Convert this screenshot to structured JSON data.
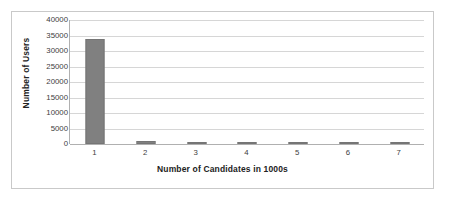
{
  "chart_data": {
    "type": "bar",
    "title": "",
    "xlabel": "Number of Candidates in 1000s",
    "ylabel": "Number of Users",
    "categories": [
      "1",
      "2",
      "3",
      "4",
      "5",
      "6",
      "7"
    ],
    "values": [
      34000,
      900,
      150,
      150,
      120,
      100,
      100
    ],
    "series": [
      {
        "name": "Number of Users",
        "values": [
          34000,
          900,
          150,
          150,
          120,
          100,
          100
        ],
        "color": "#808080"
      }
    ],
    "ylim": [
      0,
      40000
    ],
    "ytick_values": [
      0,
      5000,
      10000,
      15000,
      20000,
      25000,
      30000,
      35000,
      40000
    ],
    "ytick_labels": [
      "0",
      "5000",
      "10000",
      "15000",
      "20000",
      "25000",
      "30000",
      "35000",
      "40000"
    ],
    "grid": true,
    "grid_axis": "y",
    "legend": false,
    "legend_position": "none",
    "bar_color": "#808080",
    "gridline_color": "#d6d6d6",
    "axis_color": "#b0b0b0",
    "border_color": "#c9c9c9",
    "background": "#ffffff"
  }
}
